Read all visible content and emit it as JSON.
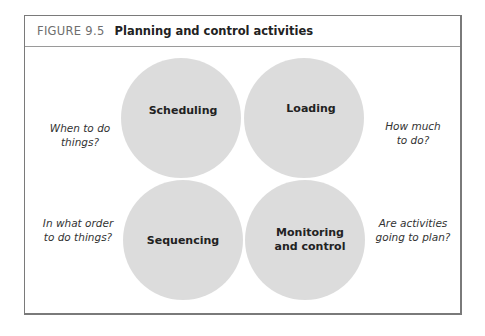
{
  "figure": {
    "number": "FIGURE 9.5",
    "title": "Planning and control activities"
  },
  "circles": [
    {
      "label": "Scheduling",
      "cx": 181,
      "cy": 118,
      "r": 60
    },
    {
      "label": "Loading",
      "cx": 304,
      "cy": 118,
      "r": 60
    },
    {
      "label": "Sequencing",
      "cx": 183,
      "cy": 240,
      "r": 60
    },
    {
      "label": "Monitoring and control",
      "label_lines": [
        "Monitoring",
        "and control"
      ],
      "cx": 305,
      "cy": 240,
      "r": 60
    }
  ],
  "questions": {
    "top_left": [
      "When to do",
      "things?"
    ],
    "top_right": [
      "How much",
      "to do?"
    ],
    "bottom_left": [
      "In what order",
      "to do things?"
    ],
    "bottom_right": [
      "Are activities",
      "going to plan?"
    ]
  },
  "colors": {
    "circle_fill": "#8c8c8c",
    "border": "#7a7a7a",
    "figure_number": "#6e6e6e"
  }
}
